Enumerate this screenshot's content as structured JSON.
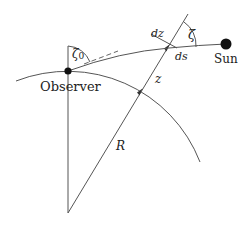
{
  "diagram": {
    "labels": {
      "observer": "Observer",
      "sun": "Sun",
      "zeta0": "ζ",
      "zeta0_sub": "0",
      "zeta": "ζ",
      "dz": "dz",
      "ds": "ds",
      "z": "z",
      "R": "R"
    },
    "colors": {
      "line": "#555555",
      "dot": "#111111",
      "text": "#222222",
      "background": "#ffffff"
    }
  }
}
